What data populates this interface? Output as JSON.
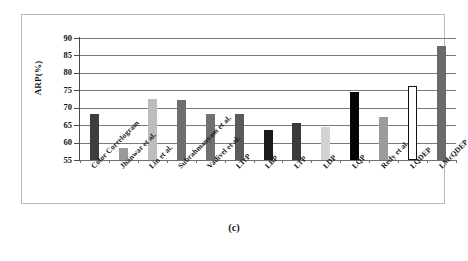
{
  "figure": {
    "caption": "(c)"
  },
  "chart_data": {
    "type": "bar",
    "title": "",
    "subtitle": "",
    "xlabel": "",
    "ylabel": "ARP(%)",
    "ylim": [
      55,
      90
    ],
    "y_ticks": [
      55,
      60,
      65,
      70,
      75,
      80,
      85,
      90
    ],
    "y_tick_labels": [
      "55",
      "60",
      "65",
      "70",
      "75",
      "80",
      "85",
      "90"
    ],
    "grid": true,
    "grid_axis": "y",
    "legend": false,
    "legend_position": "none",
    "categories": [
      "Color Correlogram",
      "Jhanwar et al.",
      "Lin et al.",
      "Subrahmanyam et al.",
      "Vadivel et al.",
      "LTrP",
      "LBP",
      "LTP",
      "LDP",
      "LQP",
      "Redy et al.",
      "LQDEP",
      "LMcQDEP"
    ],
    "values": [
      68.1,
      58.5,
      72.5,
      72.2,
      68.3,
      68.1,
      63.5,
      65.7,
      64.5,
      74.5,
      67.4,
      76.2,
      87.8
    ],
    "bar_colors": [
      "#3e3e3e",
      "#9a9a9a",
      "#bdbdbd",
      "#6e6e6e",
      "#707070",
      "#5a5a5a",
      "#1a1a1a",
      "#3a3a3a",
      "#d3d3d3",
      "#050505",
      "#9b9b9b",
      "#ffffff",
      "#6a6a6a"
    ],
    "bar_edge_colors": [
      "#3e3e3e",
      "#9a9a9a",
      "#bdbdbd",
      "#6e6e6e",
      "#707070",
      "#5a5a5a",
      "#1a1a1a",
      "#3a3a3a",
      "#d3d3d3",
      "#050505",
      "#9b9b9b",
      "#111111",
      "#6a6a6a"
    ],
    "bar_filled": [
      true,
      true,
      true,
      true,
      true,
      true,
      true,
      true,
      true,
      true,
      true,
      false,
      true
    ]
  }
}
